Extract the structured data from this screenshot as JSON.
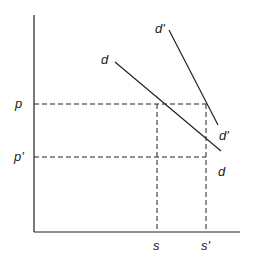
{
  "diagram": {
    "type": "supply-demand shift diagram",
    "axes": {
      "y_axis": {
        "x": 34,
        "y_top": 15,
        "y_bottom": 232
      },
      "x_axis": {
        "y": 232,
        "x_left": 34,
        "x_right": 240
      }
    },
    "price_levels": [
      {
        "label": "p",
        "y": 104
      },
      {
        "label": "p'",
        "y": 157
      }
    ],
    "quantity_levels": [
      {
        "label": "s",
        "x": 157
      },
      {
        "label": "s'",
        "x": 206
      }
    ],
    "curves": [
      {
        "name": "d",
        "start_label": "d",
        "end_label": "d",
        "x1": 115,
        "y1": 62,
        "x2": 221,
        "y2": 151
      },
      {
        "name": "d'",
        "start_label": "d'",
        "end_label": "d'",
        "x1": 169,
        "y1": 30,
        "x2": 218,
        "y2": 125
      }
    ],
    "labels": {
      "p": "p",
      "p_prime": "p'",
      "s": "s",
      "s_prime": "s'",
      "d_top": "d",
      "d_bottom": "d",
      "d_prime_top": "d'",
      "d_prime_bottom": "d'"
    },
    "colors": {
      "line": "#222222",
      "background": "#ffffff"
    }
  }
}
